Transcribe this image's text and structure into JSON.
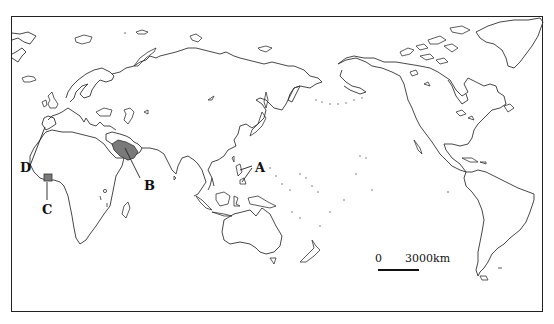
{
  "map": {
    "projection": "Pacific-centered world map",
    "labels": [
      {
        "id": "A",
        "text": "A",
        "description": "Philippines region (leader lines to islands)"
      },
      {
        "id": "B",
        "text": "B",
        "description": "Arabian Peninsula (shaded)"
      },
      {
        "id": "C",
        "text": "C",
        "description": "West Africa, Gulf of Guinea coast (shaded)"
      },
      {
        "id": "D",
        "text": "D",
        "description": "Strait of Gibraltar"
      }
    ],
    "scale_bar": {
      "start_label": "0",
      "end_label": "3000km"
    },
    "colors": {
      "border": "#222222",
      "coastline": "#333333",
      "shaded_region": "#7a7a7a",
      "background": "#ffffff"
    }
  }
}
